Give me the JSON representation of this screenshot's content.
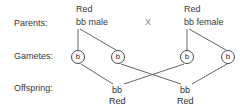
{
  "diagram": {
    "rows": [
      {
        "label": "Parents:"
      },
      {
        "label": "Gametes:"
      },
      {
        "label": "Offspring:"
      }
    ],
    "cross_symbol": "X",
    "parents": [
      {
        "phenotype": "Red",
        "genotype": "bb male"
      },
      {
        "phenotype": "Red",
        "genotype": "bb female"
      }
    ],
    "gametes": [
      {
        "allele": "b"
      },
      {
        "allele": "b"
      },
      {
        "allele": "b"
      },
      {
        "allele": "b"
      }
    ],
    "offspring": [
      {
        "genotype": "bb",
        "phenotype": "Red"
      },
      {
        "genotype": "bb",
        "phenotype": "Red"
      }
    ],
    "colors": {
      "text": "#3a3a3a",
      "line": "#555555",
      "background": "#ffffff"
    }
  }
}
